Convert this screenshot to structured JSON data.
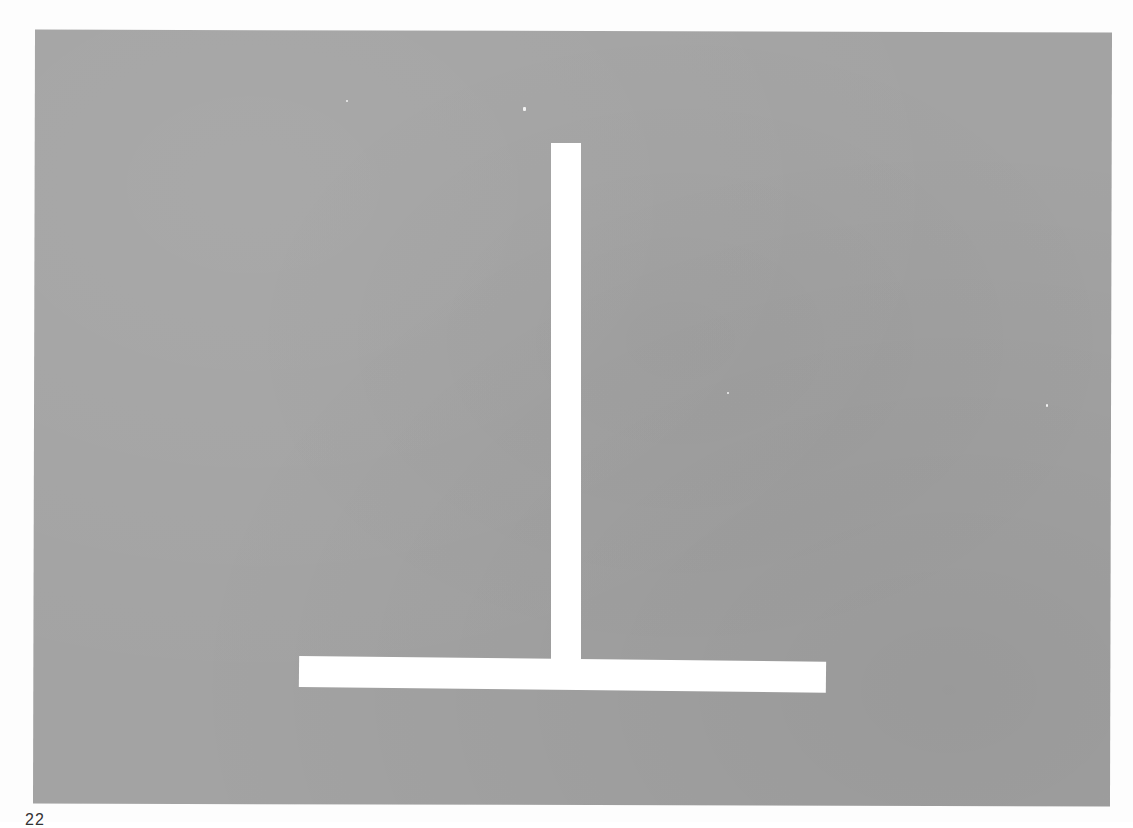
{
  "page": {
    "number": "22",
    "background_color": "#fdfdfd"
  },
  "figure": {
    "plate_color": "#a3a3a3",
    "bar_color": "#ffffff",
    "vertical_bar": {
      "x": 551,
      "y": 143,
      "width": 30,
      "height": 516
    },
    "horizontal_bar": {
      "x": 299,
      "y": 656,
      "width": 527,
      "height": 31
    }
  }
}
